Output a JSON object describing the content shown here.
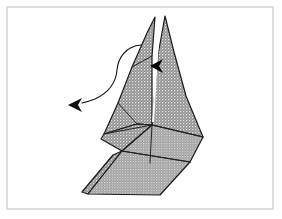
{
  "figure": {
    "canvas": {
      "width": 282,
      "height": 219
    },
    "background_color": "#ffffff"
  },
  "frame": {
    "name": "page-border",
    "x": 7,
    "y": 7,
    "width": 266,
    "height": 202,
    "stroke_color": "#d2d2d2",
    "stroke_width": 1.4
  },
  "style": {
    "paper_fill_color": "#8e8e8e",
    "paper_texture_dot_color": "#e8e8e8",
    "outline_color": "#1a1a1a",
    "outline_width": 1.2,
    "fold_line_color": "#222222",
    "fold_line_width": 1.0,
    "arrow_color": "#111111",
    "arrow_stroke_width": 1.1,
    "slit_color": "#ffffff",
    "marker_fill_color": "#000000"
  },
  "shapes": {
    "left_peak_face": {
      "label": "left pointed peak face",
      "points": "155,17 147,33 132,67 118,103 104,134 137,124 152,125 152,56"
    },
    "right_peak_face": {
      "label": "right pointed peak face",
      "points": "165,16 158,55 152,125 203,137 186,96 174,52"
    },
    "center_left_wedge": {
      "label": "center left wedge face",
      "points": "104,134 137,124 152,125 122,151 101,139"
    },
    "center_lower_wedge": {
      "label": "center lower wedge face",
      "points": "152,125 122,151 150,163 190,162 203,137"
    },
    "lower_flap_face": {
      "label": "lower flap / foot face",
      "points": "122,151 190,162 160,195 88,194"
    },
    "lower_flap_under_face": {
      "label": "lower flap underside sliver",
      "points": "113,155 122,151 88,194 82,192"
    }
  },
  "fold_lines": [
    {
      "name": "fold-left-peak-inner",
      "d": "M 152,56 L 132,67"
    },
    {
      "name": "fold-center-spoke-upleft",
      "d": "M 152,125 L 137,124"
    },
    {
      "name": "fold-center-spoke-left",
      "d": "M 152,125 L 104,134"
    },
    {
      "name": "fold-center-spoke-downleft",
      "d": "M 152,125 L 122,151"
    },
    {
      "name": "fold-center-spoke-right",
      "d": "M 152,125 L 203,137"
    },
    {
      "name": "fold-center-spoke-down",
      "d": "M 152,125 L 150,163"
    },
    {
      "name": "fold-upper-left-crease",
      "d": "M 137,124 L 118,103"
    },
    {
      "name": "fold-lower-flap-top",
      "d": "M 122,151 L 190,162"
    },
    {
      "name": "fold-flap-under-edge",
      "d": "M 113,155 L 82,192"
    }
  ],
  "slit": {
    "name": "center-slit",
    "d": "M 159,26 L 153,122",
    "color": "#ffffff",
    "width": 2.0
  },
  "motion_arrow": {
    "name": "fold-motion-arrow",
    "label": "curved motion arrow indicating the flap swings to the lower left",
    "path": "M 141,45 C 126,46 118,58 117,70 C 116,82 110,92 95,99 C 90,101 86,102 82,103",
    "head_points": "82,98 68,105 82,112 78,105",
    "direction": "left"
  },
  "inner_marker": {
    "name": "slit-pointer-arrowhead",
    "label": "solid arrowhead marking the slit opening",
    "points": "163,59 150,66 163,73 159,66"
  }
}
